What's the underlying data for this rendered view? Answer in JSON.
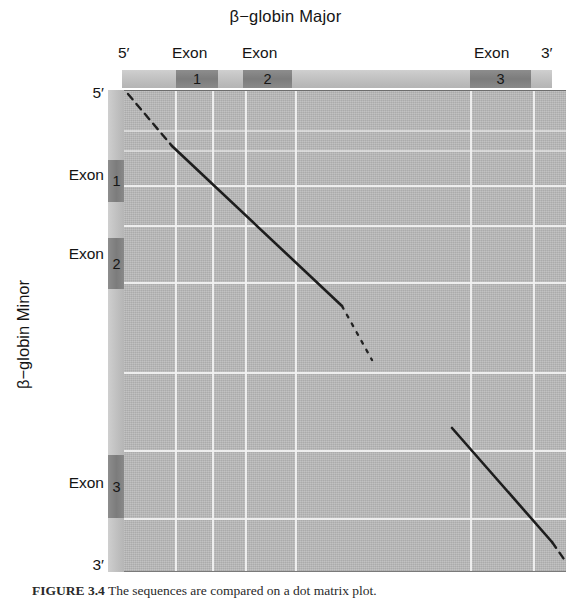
{
  "figure": {
    "title": "β−globin Major",
    "y_axis_title": "β−globin Minor",
    "caption_number": "FIGURE 3.4",
    "caption_text": "The sequences are compared on a dot matrix plot."
  },
  "top_axis": {
    "labels": [
      {
        "text": "5′",
        "x": 118,
        "name": "top-label-five-prime"
      },
      {
        "text": "Exon",
        "x": 172,
        "name": "top-label-exon-1"
      },
      {
        "text": "Exon",
        "x": 242,
        "name": "top-label-exon-2"
      },
      {
        "text": "Exon",
        "x": 474,
        "name": "top-label-exon-3"
      },
      {
        "text": "3′",
        "x": 541,
        "name": "top-label-three-prime"
      }
    ],
    "exon_blocks": [
      {
        "number": "1",
        "x": 176,
        "width": 42,
        "name": "top-exon-block-1"
      },
      {
        "number": "2",
        "x": 243,
        "width": 49,
        "name": "top-exon-block-2"
      },
      {
        "number": "3",
        "x": 470,
        "width": 61,
        "name": "top-exon-block-3"
      }
    ]
  },
  "left_axis": {
    "labels": [
      {
        "text": "5′",
        "y": 84,
        "name": "left-label-five-prime"
      },
      {
        "text": "Exon",
        "y": 166,
        "name": "left-label-exon-1"
      },
      {
        "text": "Exon",
        "y": 245,
        "name": "left-label-exon-2"
      },
      {
        "text": "Exon",
        "y": 474,
        "name": "left-label-exon-3"
      },
      {
        "text": "3′",
        "y": 556,
        "name": "left-label-three-prime"
      }
    ],
    "exon_blocks": [
      {
        "number": "1",
        "y": 160,
        "height": 42,
        "name": "left-exon-block-1"
      },
      {
        "number": "2",
        "y": 238,
        "height": 51,
        "name": "left-exon-block-2"
      },
      {
        "number": "3",
        "y": 455,
        "height": 63,
        "name": "left-exon-block-3"
      }
    ]
  },
  "chart_data": {
    "type": "scatter",
    "title": "β−globin Major",
    "xlabel": "β−globin Major",
    "ylabel": "β−globin Minor",
    "axis_ranges": {
      "x": [
        0,
        1
      ],
      "y": [
        0,
        1
      ]
    },
    "grid": true,
    "legend": "none",
    "x_gridlines_px": [
      51,
      88,
      121,
      171,
      346,
      409
    ],
    "y_gridlines_px": [
      40,
      60,
      95,
      135,
      192,
      282,
      360,
      428
    ],
    "series": [
      {
        "name": "diagonal-segment-5prime-dashed",
        "style": "dashed",
        "points": [
          [
            4,
            4
          ],
          [
            48,
            56
          ]
        ]
      },
      {
        "name": "diagonal-segment-exon1-exon2-solid",
        "style": "solid",
        "points": [
          [
            48,
            56
          ],
          [
            218,
            216
          ]
        ]
      },
      {
        "name": "diagonal-segment-intron2-fading",
        "style": "dotted",
        "points": [
          [
            218,
            216
          ],
          [
            248,
            270
          ]
        ]
      },
      {
        "name": "diagonal-segment-exon3-solid",
        "style": "solid",
        "points": [
          [
            328,
            338
          ],
          [
            428,
            452
          ]
        ]
      },
      {
        "name": "diagonal-segment-3prime-dashed",
        "style": "dashed",
        "points": [
          [
            428,
            452
          ],
          [
            442,
            472
          ]
        ]
      }
    ]
  },
  "colors": {
    "plot_background": "#b6b6b6",
    "gridline": "#f2f2f2",
    "gene_bar": "#c2c2c2",
    "exon_block": "#7c7c7c",
    "match_line": "#1d1d1d",
    "text": "#141414",
    "page_background": "#ffffff"
  }
}
